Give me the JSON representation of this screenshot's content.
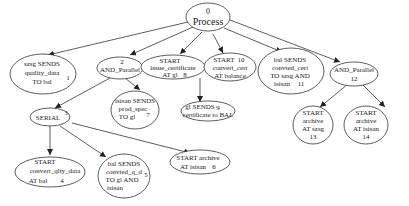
{
  "diagram": {
    "type": "process-tree",
    "nodes": [
      {
        "id": "0",
        "lines": [
          "0",
          "Process"
        ],
        "label": "Process"
      },
      {
        "id": "1",
        "lines": [
          "szsg SENDS",
          "quality_data",
          "TO bal"
        ],
        "num": "1"
      },
      {
        "id": "2",
        "lines": [
          "2",
          "AND_Parallel"
        ],
        "label": "AND_Parallel"
      },
      {
        "id": "3",
        "lines": [
          "SERIAL"
        ],
        "num": "3"
      },
      {
        "id": "4",
        "lines": [
          "START",
          "convert_qlty_data",
          "AT bal"
        ],
        "num": "4"
      },
      {
        "id": "5",
        "lines": [
          "bal SENDS",
          "convted_q_d",
          "TO gl AND",
          "isisan"
        ],
        "num": "5"
      },
      {
        "id": "6",
        "lines": [
          "START archive",
          "AT isisan"
        ],
        "num": "6"
      },
      {
        "id": "7",
        "lines": [
          "isisan SENDS",
          "prod_spec",
          "TO gl"
        ],
        "num": "7"
      },
      {
        "id": "8",
        "lines": [
          "START",
          "issue_certificate",
          "AT gl"
        ],
        "num": "8"
      },
      {
        "id": "9",
        "lines": [
          "gl SENDS",
          "certificate to BAL"
        ],
        "num": "9"
      },
      {
        "id": "10",
        "lines": [
          "START",
          "convert_cert",
          "AT balance"
        ],
        "num": "10"
      },
      {
        "id": "11",
        "lines": [
          "bal SENDS",
          "convted_cert",
          "TO szsg AND",
          "isisan"
        ],
        "num": "11"
      },
      {
        "id": "12",
        "lines": [
          "AND_Parallel",
          "12"
        ],
        "label": "AND_Parallel"
      },
      {
        "id": "13",
        "lines": [
          "START",
          "archive",
          "AT szsg",
          "13"
        ]
      },
      {
        "id": "14",
        "lines": [
          "START",
          "archive",
          "AT isisan",
          "14"
        ]
      }
    ],
    "edges": [
      [
        "0",
        "1"
      ],
      [
        "0",
        "2"
      ],
      [
        "0",
        "8"
      ],
      [
        "0",
        "10"
      ],
      [
        "0",
        "11"
      ],
      [
        "0",
        "12"
      ],
      [
        "2",
        "3"
      ],
      [
        "2",
        "7"
      ],
      [
        "3",
        "4"
      ],
      [
        "3",
        "5"
      ],
      [
        "3",
        "6"
      ],
      [
        "10",
        "9"
      ],
      [
        "12",
        "13"
      ],
      [
        "12",
        "14"
      ]
    ]
  }
}
